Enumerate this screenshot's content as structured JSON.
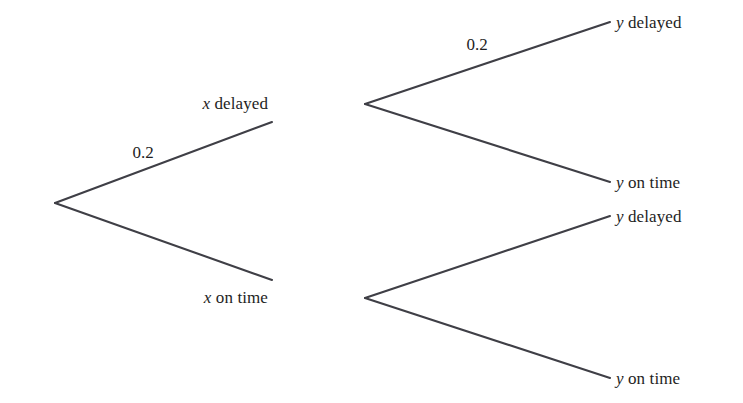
{
  "diagram": {
    "type": "probability-tree",
    "title": "",
    "line_color": "#3f3f46",
    "text_color": "#1e1e1e",
    "background_color": "#ffffff",
    "root": {
      "label": "",
      "x": 55,
      "y": 203
    },
    "level1": [
      {
        "id": "x-delayed",
        "variable": "x",
        "state": "delayed",
        "label_x": 268,
        "label_y": 103,
        "fork_x": 365,
        "fork_y": 104,
        "branch_end_x": 272,
        "branch_end_y": 122,
        "probability": "0.2",
        "prob_x": 143,
        "prob_y": 152
      },
      {
        "id": "x-on-time",
        "variable": "x",
        "state": "on time",
        "label_x": 268,
        "label_y": 297,
        "fork_x": 365,
        "fork_y": 298,
        "branch_end_x": 272,
        "branch_end_y": 280,
        "probability": "",
        "prob_x": 0,
        "prob_y": 0
      }
    ],
    "level2": [
      {
        "id": "x-delayed-y-delayed",
        "parent": "x-delayed",
        "variable": "y",
        "state": "delayed",
        "end_x": 610,
        "end_y": 22,
        "label_x": 616,
        "label_y": 22,
        "probability": "0.2",
        "prob_x": 477,
        "prob_y": 44
      },
      {
        "id": "x-delayed-y-on-time",
        "parent": "x-delayed",
        "variable": "y",
        "state": "on time",
        "end_x": 610,
        "end_y": 182,
        "label_x": 616,
        "label_y": 182,
        "probability": "",
        "prob_x": 0,
        "prob_y": 0
      },
      {
        "id": "x-on-time-y-delayed",
        "parent": "x-on-time",
        "variable": "y",
        "state": "delayed",
        "end_x": 610,
        "end_y": 216,
        "label_x": 616,
        "label_y": 216,
        "probability": "",
        "prob_x": 0,
        "prob_y": 0
      },
      {
        "id": "x-on-time-y-on-time",
        "parent": "x-on-time",
        "variable": "y",
        "state": "on time",
        "end_x": 610,
        "end_y": 378,
        "label_x": 616,
        "label_y": 378,
        "probability": "",
        "prob_x": 0,
        "prob_y": 0
      }
    ]
  },
  "labels": {
    "x_delayed_var": "x",
    "x_delayed_txt": " delayed",
    "x_on_time_var": "x",
    "x_on_time_txt": " on time",
    "y1_var": "y",
    "y1_txt": " delayed",
    "y2_var": "y",
    "y2_txt": " on time",
    "y3_var": "y",
    "y3_txt": " delayed",
    "y4_var": "y",
    "y4_txt": " on time",
    "prob_root_upper": "0.2",
    "prob_xdelayed_upper": "0.2"
  }
}
